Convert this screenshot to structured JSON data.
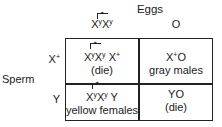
{
  "diagram": {
    "title": "Eggs",
    "side_label": "Sperm",
    "columns": [
      {
        "base": "X",
        "sup": "y",
        "base2": "X",
        "sup2": "y",
        "attached": true,
        "label": "X^yX^y (attached)"
      },
      {
        "label": "O"
      }
    ],
    "rows": [
      {
        "base": "X",
        "sup": "+",
        "label": "X+"
      },
      {
        "label": "Y"
      }
    ],
    "cells": [
      [
        {
          "genotype": "X^yX^y X+ (attached)",
          "g_a": "X",
          "g_a_sup": "y",
          "g_b": "X",
          "g_b_sup": "y",
          "g_c": " X",
          "g_c_sup": "+",
          "phenotype": "(die)"
        },
        {
          "genotype": "X+O",
          "g_a": "X",
          "g_a_sup": "+",
          "g_rest": "O",
          "phenotype": "gray males"
        }
      ],
      [
        {
          "genotype": "X^yX^y Y (attached)",
          "g_a": "X",
          "g_a_sup": "y",
          "g_b": "X",
          "g_b_sup": "y",
          "g_c": " Y",
          "phenotype": "yellow females"
        },
        {
          "genotype": "YO",
          "phenotype": "(die)"
        }
      ]
    ]
  }
}
